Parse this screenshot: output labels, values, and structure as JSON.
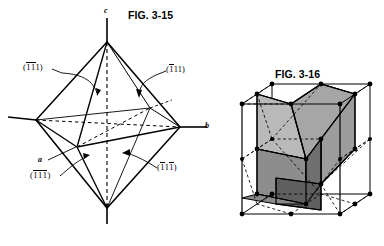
{
  "figures": {
    "left": {
      "title": "FIG. 3-15",
      "subject": "octahedron-with-crystallographic-axes",
      "axes": [
        {
          "name": "c",
          "label": "c",
          "orientation": "vertical",
          "position": "top"
        },
        {
          "name": "b",
          "label": "b",
          "orientation": "right",
          "position": "right"
        },
        {
          "name": "a",
          "label": "a",
          "orientation": "left-front",
          "position": "lower-left"
        }
      ],
      "face_labels": [
        {
          "id": "upper-left",
          "text": "(1̱1̱1)",
          "indices": [
            "-1",
            "-1",
            "1"
          ],
          "display": "(̅1̅1 1)"
        },
        {
          "id": "upper-right",
          "text": "(1̱ 1 1)",
          "indices": [
            "-1",
            "1",
            "1"
          ],
          "display": "(̅1 1 1)"
        },
        {
          "id": "lower-left",
          "text": "(1̱ 1̱ 1̱)",
          "indices": [
            "-1",
            "-1",
            "-1"
          ],
          "display": "(̅1̅1̅1)"
        },
        {
          "id": "lower-right",
          "text": "(1̱ 1 1̱)",
          "indices": [
            "-1",
            "1",
            "-1"
          ],
          "display": "(̅1 1̅1)"
        }
      ],
      "labels": {
        "axis_c": "c",
        "axis_b": "b",
        "axis_a": "a",
        "face_ul_open": "(",
        "face_ul_d1": "1",
        "face_ul_d2": "1",
        "face_ul_d3": "1",
        "face_ul_close": ")",
        "face_ur_open": "(",
        "face_ur_d1": "1",
        "face_ur_d2": "1",
        "face_ur_d3": "1",
        "face_ur_close": ")",
        "face_ll_open": "(",
        "face_ll_d1": "1",
        "face_ll_d2": "1",
        "face_ll_d3": "1",
        "face_ll_close": ")",
        "face_lr_open": "(",
        "face_lr_d1": "1",
        "face_lr_d2": "1",
        "face_lr_d3": "1",
        "face_lr_close": ")"
      }
    },
    "right": {
      "title": "FIG. 3-16",
      "subject": "cube-with-inscribed-shaded-rhombohedron",
      "vertex_count": 14,
      "has_dashed_construction_lines": true
    }
  },
  "colors": {
    "ink": "#000000",
    "background": "#ffffff",
    "shade_light": "#b9b9b9",
    "shade_mid": "#a0a0a0",
    "shade_dark": "#7a7a7a",
    "shade_darker": "#636363"
  }
}
